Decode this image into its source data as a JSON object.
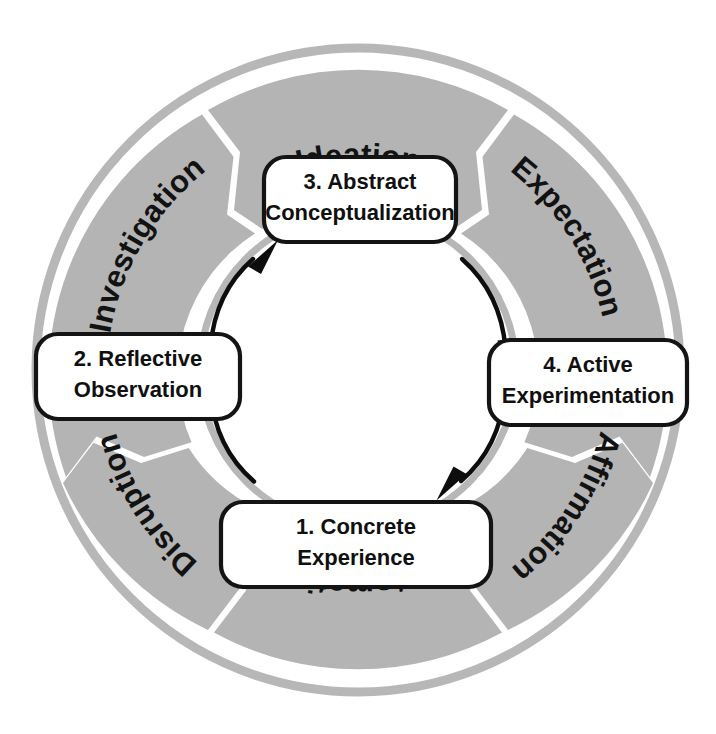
{
  "diagram": {
    "geometry": {
      "center_x": 358,
      "center_y": 370,
      "outer_thin_ring_radius": 322,
      "outer_thin_ring_width": 9,
      "wedge_outer_radius": 300,
      "wedge_inner_radius": 168,
      "inner_thin_ring_radius": 158,
      "inner_thin_ring_width": 7
    },
    "colors": {
      "wedge_fill": "#b4b4b4",
      "thin_ring": "#b7b7b7",
      "background": "#ffffff",
      "text": "#121212",
      "box_fill": "#ffffff",
      "box_stroke": "#141414",
      "arrow": "#0d0d0d"
    },
    "ring_labels": [
      {
        "id": "ideation",
        "text": "Ideation",
        "position": "top",
        "angle_deg": -90,
        "curved": true,
        "flip": false
      },
      {
        "id": "expectation",
        "text": "Expectation",
        "position": "upper-right",
        "angle_deg": -35,
        "curved": true,
        "flip": false
      },
      {
        "id": "affirmation",
        "text": "Affirmation",
        "position": "lower-right",
        "angle_deg": 35,
        "curved": true,
        "flip": false
      },
      {
        "id": "automation",
        "text": "Automation",
        "position": "bottom",
        "angle_deg": 90,
        "curved": true,
        "flip": true
      },
      {
        "id": "disruption",
        "text": "Disruption",
        "position": "lower-left",
        "angle_deg": 145,
        "curved": true,
        "flip": true
      },
      {
        "id": "investigation",
        "text": "Investigation",
        "position": "upper-left",
        "angle_deg": -145,
        "curved": true,
        "flip": false
      }
    ],
    "stages": [
      {
        "id": "concrete-experience",
        "number": "1.",
        "line1": "1. Concrete",
        "line2": "Experience",
        "full_label": "1. Concrete Experience",
        "position": "bottom"
      },
      {
        "id": "reflective-observation",
        "number": "2.",
        "line1": "2. Reflective",
        "line2": "Observation",
        "full_label": "2. Reflective Observation",
        "position": "left"
      },
      {
        "id": "abstract-conceptualization",
        "number": "3.",
        "line1": "3. Abstract",
        "line2": "Conceptualization",
        "full_label": "3. Abstract Conceptualization",
        "position": "top"
      },
      {
        "id": "active-experimentation",
        "number": "4.",
        "line1": "4. Active",
        "line2": "Experimentation",
        "full_label": "4. Active Experimentation",
        "position": "right"
      }
    ],
    "flow_arrows": [
      {
        "id": "arrow-reflective-to-abstract",
        "from": "reflective-observation",
        "to": "abstract-conceptualization",
        "direction": "clockwise"
      },
      {
        "id": "arrow-abstract-to-active",
        "from": "abstract-conceptualization",
        "to": "active-experimentation",
        "direction": "clockwise"
      },
      {
        "id": "arrow-active-to-concrete",
        "from": "active-experimentation",
        "to": "concrete-experience",
        "direction": "clockwise"
      },
      {
        "id": "arrow-concrete-to-reflective",
        "from": "concrete-experience",
        "to": "reflective-observation",
        "direction": "clockwise"
      }
    ]
  }
}
